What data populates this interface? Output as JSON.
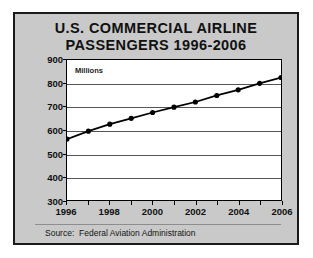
{
  "chart_data": {
    "type": "line",
    "title": "U.S. COMMERCIAL AIRLINE PASSENGERS 1996-2006",
    "title_line1": "U.S. COMMERCIAL AIRLINE",
    "title_line2": "PASSENGERS 1996-2006",
    "unit_label": "Millions",
    "xlabel": "",
    "ylabel": "Millions",
    "x": [
      1996,
      1997,
      1998,
      1999,
      2000,
      2001,
      2002,
      2003,
      2004,
      2005,
      2006
    ],
    "values": [
      561,
      595,
      625,
      650,
      675,
      698,
      720,
      748,
      772,
      800,
      825
    ],
    "categories": [
      "1996",
      "1997",
      "1998",
      "1999",
      "2000",
      "2001",
      "2002",
      "2003",
      "2004",
      "2005",
      "2006"
    ],
    "series": [
      {
        "name": "U.S. Commercial Airline Passengers",
        "values": [
          561,
          595,
          625,
          650,
          675,
          698,
          720,
          748,
          772,
          800,
          825
        ]
      }
    ],
    "ylim": [
      300,
      900
    ],
    "ytick_values": [
      900,
      800,
      700,
      600,
      500,
      400,
      300
    ],
    "ytick_labels": [
      "900",
      "800",
      "700",
      "600",
      "500",
      "400",
      "300"
    ],
    "xlim": [
      1996,
      2006
    ],
    "xtick_values": [
      1996,
      1998,
      2000,
      2002,
      2004,
      2006
    ],
    "xtick_labels": [
      "1996",
      "1998",
      "2000",
      "2002",
      "2004",
      "2006"
    ],
    "xminor_tick_values": [
      1997,
      1999,
      2001,
      2003,
      2005
    ],
    "grid": true,
    "grid_axis": "y",
    "legend": false,
    "legend_position": "none",
    "annotations": [
      "Millions"
    ],
    "source": "Source:  Federal Aviation Administration",
    "colors": {
      "card_background": "#c9c9c9",
      "plot_background": "#ffffff",
      "frame": "#1a1a1a",
      "series_line": "#000000",
      "marker": "#000000",
      "gridline": "#555555",
      "text": "#111111"
    }
  }
}
